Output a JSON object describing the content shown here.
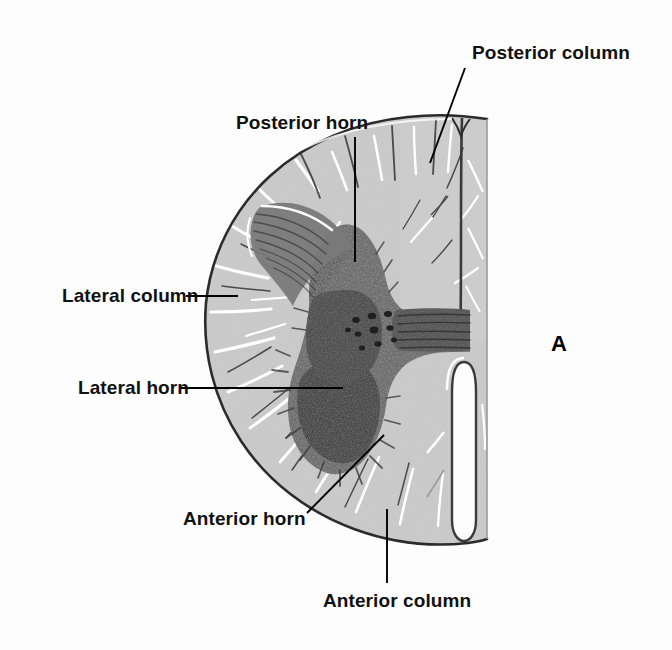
{
  "figure": {
    "panel_letter": "A",
    "colors": {
      "background": "#fdfdfd",
      "white_matter": "#c8c8c8",
      "white_matter_light": "#d6d6d6",
      "gray_matter": "#555555",
      "gray_matter_dark": "#3a3a3a",
      "outline": "#2b2b2b",
      "leader_line": "#000000",
      "label_text": "#111111",
      "sulcus_white": "#ffffff"
    }
  },
  "labels": [
    {
      "id": "posterior-column",
      "text": "Posterior column",
      "x": 472,
      "y": 42,
      "leader": {
        "x1": 465,
        "y1": 68,
        "x2": 430,
        "y2": 163
      }
    },
    {
      "id": "posterior-horn",
      "text": "Posterior horn",
      "x": 236,
      "y": 112,
      "leader": {
        "x1": 355,
        "y1": 137,
        "x2": 355,
        "y2": 262
      }
    },
    {
      "id": "lateral-column",
      "text": "Lateral column",
      "x": 62,
      "y": 285,
      "leader": {
        "x1": 186,
        "y1": 296,
        "x2": 238,
        "y2": 296
      }
    },
    {
      "id": "lateral-horn",
      "text": "Lateral horn",
      "x": 78,
      "y": 377,
      "leader": {
        "x1": 181,
        "y1": 388,
        "x2": 343,
        "y2": 388
      }
    },
    {
      "id": "anterior-horn",
      "text": "Anterior horn",
      "x": 183,
      "y": 508,
      "leader": {
        "x1": 307,
        "y1": 513,
        "x2": 384,
        "y2": 435
      }
    },
    {
      "id": "anterior-column",
      "text": "Anterior column",
      "x": 323,
      "y": 590,
      "leader": {
        "x1": 387,
        "y1": 583,
        "x2": 387,
        "y2": 509
      }
    }
  ],
  "panel": {
    "letter": "A",
    "x": 551,
    "y": 331
  }
}
